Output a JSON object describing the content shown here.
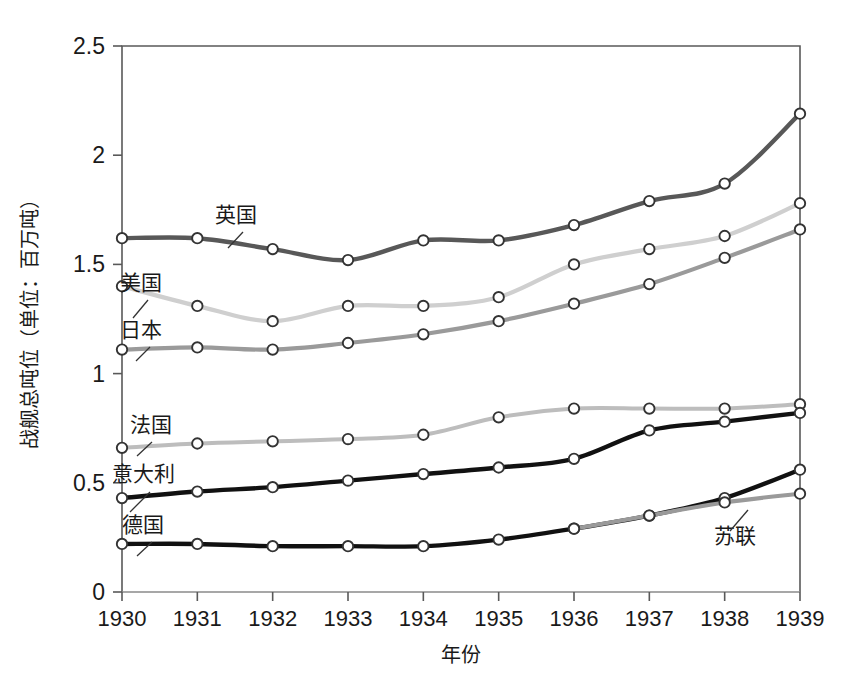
{
  "chart_data": {
    "type": "line",
    "title": "",
    "xlabel": "年份",
    "ylabel": "战舰总吨位（单位：百万吨）",
    "x": [
      1930,
      1931,
      1932,
      1933,
      1934,
      1935,
      1936,
      1937,
      1938,
      1939
    ],
    "categories": [
      "1930",
      "1931",
      "1932",
      "1933",
      "1934",
      "1935",
      "1936",
      "1937",
      "1938",
      "1939"
    ],
    "xlim": [
      1930,
      1939
    ],
    "ylim": [
      0,
      2.5
    ],
    "ytick_labels": [
      "0",
      "0.5",
      "1",
      "1.5",
      "2",
      "2.5"
    ],
    "ytick_values": [
      0,
      0.5,
      1,
      1.5,
      2,
      2.5
    ],
    "grid": false,
    "legend_position": "inline-labels",
    "series": [
      {
        "name": "英国",
        "color": "#585858",
        "values": [
          1.62,
          1.62,
          1.57,
          1.52,
          1.61,
          1.61,
          1.68,
          1.79,
          1.87,
          2.19
        ]
      },
      {
        "name": "美国",
        "color": "#cfcfcf",
        "values": [
          1.4,
          1.31,
          1.24,
          1.31,
          1.31,
          1.35,
          1.5,
          1.57,
          1.63,
          1.78
        ]
      },
      {
        "name": "日本",
        "color": "#9a9a9a",
        "values": [
          1.11,
          1.12,
          1.11,
          1.14,
          1.18,
          1.24,
          1.32,
          1.41,
          1.53,
          1.66
        ]
      },
      {
        "name": "法国",
        "color": "#bdbdbd",
        "values": [
          0.66,
          0.68,
          0.69,
          0.7,
          0.72,
          0.8,
          0.84,
          0.84,
          0.84,
          0.86
        ]
      },
      {
        "name": "意大利",
        "color": "#111111",
        "values": [
          0.43,
          0.46,
          0.48,
          0.51,
          0.54,
          0.57,
          0.61,
          0.74,
          0.78,
          0.82
        ]
      },
      {
        "name": "德国",
        "color": "#111111",
        "values": [
          0.22,
          0.22,
          0.21,
          0.21,
          0.21,
          0.24,
          0.29,
          0.35,
          0.43,
          0.56
        ]
      },
      {
        "name": "苏联",
        "color": "#9a9a9a",
        "values": [
          0.22,
          0.22,
          0.21,
          0.21,
          0.21,
          0.24,
          0.29,
          0.35,
          0.41,
          0.45
        ]
      }
    ],
    "series_annotations": [
      {
        "name": "英国",
        "label": "英国"
      },
      {
        "name": "美国",
        "label": "美国"
      },
      {
        "name": "日本",
        "label": "日本"
      },
      {
        "name": "法国",
        "label": "法国"
      },
      {
        "name": "意大利",
        "label": "意大利"
      },
      {
        "name": "德国",
        "label": "德国"
      },
      {
        "name": "苏联",
        "label": "苏联"
      }
    ]
  },
  "axes": {
    "frame_color": "#595959",
    "background": "#ffffff"
  }
}
